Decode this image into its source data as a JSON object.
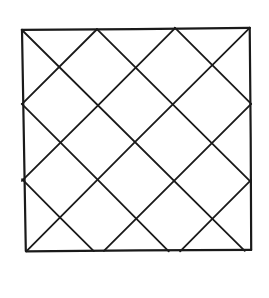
{
  "figure": {
    "type": "line-drawing",
    "style": "hand-drawn-ink",
    "background_color": "#ffffff",
    "stroke_color": "#1a1a1a",
    "border_stroke_width": 2.2,
    "lattice_stroke_width": 1.8,
    "canvas": {
      "width": 269,
      "height": 298
    }
  },
  "chart_data": {
    "type": "diagram",
    "xlabel": "",
    "ylabel": "",
    "grid": false,
    "legend": false,
    "square_outline": {
      "name": "outer-square",
      "points": [
        [
          22,
          30
        ],
        [
          250,
          28
        ],
        [
          251,
          250
        ],
        [
          26,
          251
        ]
      ],
      "closed": true
    },
    "lattice_angle_degrees": 45,
    "lattice_spacing_px": 53,
    "edge_vertices": {
      "top": [
        22,
        97,
        175,
        250
      ],
      "bottom": [
        26,
        88,
        166,
        251
      ],
      "left": [
        30,
        100,
        175,
        251
      ],
      "right": [
        28,
        100,
        174,
        250
      ]
    },
    "lines": [
      {
        "name": "d1-a",
        "from": [
          22,
          30
        ],
        "to": [
          245,
          251
        ]
      },
      {
        "name": "d1-b",
        "from": [
          97,
          29
        ],
        "to": [
          251,
          182
        ]
      },
      {
        "name": "d1-c",
        "from": [
          175,
          28
        ],
        "to": [
          251,
          104
        ]
      },
      {
        "name": "d1-d",
        "from": [
          22,
          104
        ],
        "to": [
          169,
          251
        ]
      },
      {
        "name": "d1-e",
        "from": [
          22,
          179
        ],
        "to": [
          94,
          251
        ]
      },
      {
        "name": "d2-a",
        "from": [
          250,
          28
        ],
        "to": [
          26,
          251
        ]
      },
      {
        "name": "d2-b",
        "from": [
          175,
          28
        ],
        "to": [
          22,
          181
        ]
      },
      {
        "name": "d2-c",
        "from": [
          97,
          29
        ],
        "to": [
          22,
          104
        ]
      },
      {
        "name": "d2-d",
        "from": [
          251,
          104
        ],
        "to": [
          104,
          251
        ]
      },
      {
        "name": "d2-e",
        "from": [
          251,
          180
        ],
        "to": [
          180,
          251
        ]
      }
    ],
    "counts": {
      "outer_edges": 4,
      "diagonals_down_right": 5,
      "diagonals_down_left": 5,
      "total_strokes": 14
    }
  }
}
